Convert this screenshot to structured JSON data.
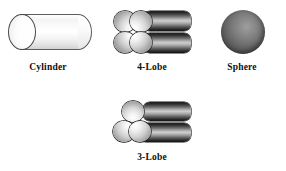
{
  "figure": {
    "background_color": "#ffffff",
    "width": 286,
    "height": 171,
    "label_color": "#101010",
    "items": [
      {
        "id": "cylinder",
        "label": "Cylinder",
        "shape": "cylinder",
        "fill": "light-gray-gradient",
        "outline_color": "#4a4a4a",
        "row": 1,
        "column": 1
      },
      {
        "id": "4-lobe",
        "label": "4-Lobe",
        "shape": "four-lobe-extrudate",
        "lobe_count": 4,
        "fill": "dark-gray-gradient",
        "outline_color": "#171717",
        "row": 1,
        "column": 2
      },
      {
        "id": "sphere",
        "label": "Sphere",
        "shape": "sphere",
        "fill": "dark-gray-radial",
        "highlight_position": "upper-right-of-center",
        "row": 1,
        "column": 3
      },
      {
        "id": "3-lobe",
        "label": "3-Lobe",
        "shape": "three-lobe-extrudate",
        "lobe_count": 3,
        "fill": "dark-gray-gradient",
        "outline_color": "#171717",
        "row": 2,
        "column": 2
      }
    ]
  }
}
